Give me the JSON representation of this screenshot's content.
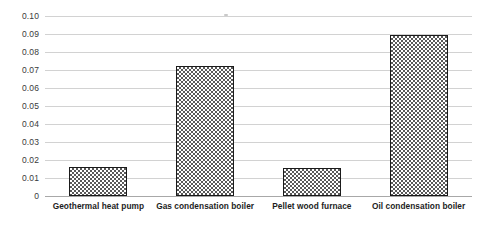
{
  "chart_data": {
    "type": "bar",
    "title": "",
    "subtitle": "",
    "xlabel": "",
    "ylabel": "",
    "categories": [
      "Geothermal heat pump",
      "Gas condensation boiler",
      "Pellet wood furnace",
      "Oil condensation boiler"
    ],
    "values": [
      0.016,
      0.072,
      0.0155,
      0.0895
    ],
    "ylim": [
      0,
      0.1
    ],
    "ytick_labels": [
      "0",
      "0.01",
      "0.02",
      "0.03",
      "0.04",
      "0.05",
      "0.06",
      "0.07",
      "0.08",
      "0.09",
      "0.10"
    ],
    "ytick_values": [
      0,
      0.01,
      0.02,
      0.03,
      0.04,
      0.05,
      0.06,
      0.07,
      0.08,
      0.09,
      0.1
    ],
    "grid": true,
    "grid_orientation": "horizontal",
    "legend": null,
    "legend_position": "none",
    "annotations": [],
    "series_fill": "checkerboard-grayscale",
    "colors": {
      "bar_pattern_dark": "#595959",
      "bar_pattern_light": "#ffffff",
      "bar_border": "#1b1b1b",
      "gridline": "#d2d2d2",
      "baseline": "#a8a8a8",
      "y_label_text": "#3a3a3a",
      "x_label_text": "#1d1d1d",
      "background": "#ffffff"
    }
  }
}
